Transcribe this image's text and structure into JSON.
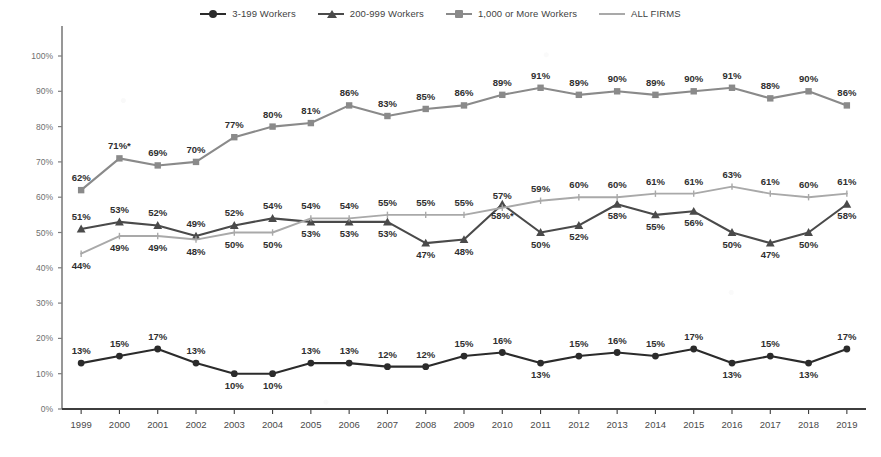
{
  "chart_data": {
    "type": "line",
    "title": "",
    "subtitle": "",
    "xlabel": "",
    "ylabel": "",
    "ylim": [
      0,
      100
    ],
    "ytick_labels": [
      "0%",
      "10%",
      "20%",
      "30%",
      "40%",
      "50%",
      "60%",
      "70%",
      "80%",
      "90%",
      "100%"
    ],
    "ytick_values": [
      0,
      10,
      20,
      30,
      40,
      50,
      60,
      70,
      80,
      90,
      100
    ],
    "grid": false,
    "legend_position": "top-center",
    "categories": [
      "1999",
      "2000",
      "2001",
      "2002",
      "2003",
      "2004",
      "2005",
      "2006",
      "2007",
      "2008",
      "2009",
      "2010",
      "2011",
      "2012",
      "2013",
      "2014",
      "2015",
      "2016",
      "2017",
      "2018",
      "2019"
    ],
    "x": [
      1999,
      2000,
      2001,
      2002,
      2003,
      2004,
      2005,
      2006,
      2007,
      2008,
      2009,
      2010,
      2011,
      2012,
      2013,
      2014,
      2015,
      2016,
      2017,
      2018,
      2019
    ],
    "series": [
      {
        "name": "3-199 Workers",
        "color": "#2b2b2b",
        "marker": "circle",
        "values": [
          13,
          15,
          17,
          13,
          10,
          10,
          13,
          13,
          12,
          12,
          15,
          16,
          13,
          15,
          16,
          15,
          17,
          13,
          15,
          13,
          17
        ],
        "labels": [
          "13%",
          "15%",
          "17%",
          "13%",
          "10%",
          "10%",
          "13%",
          "13%",
          "12%",
          "12%",
          "15%",
          "16%",
          "13%",
          "15%",
          "16%",
          "15%",
          "17%",
          "13%",
          "15%",
          "13%",
          "17%"
        ],
        "label_side": [
          "above",
          "above",
          "above",
          "above",
          "below",
          "below",
          "above",
          "above",
          "above",
          "above",
          "above",
          "above",
          "below",
          "above",
          "above",
          "above",
          "above",
          "below",
          "above",
          "below",
          "above"
        ]
      },
      {
        "name": "200-999 Workers",
        "color": "#4a4a4a",
        "marker": "triangle",
        "values": [
          51,
          53,
          52,
          49,
          52,
          54,
          53,
          53,
          53,
          47,
          48,
          58,
          50,
          52,
          58,
          55,
          56,
          50,
          47,
          50,
          58
        ],
        "labels": [
          "51%",
          "53%",
          "52%",
          "49%",
          "52%",
          "54%",
          "53%",
          "53%",
          "53%",
          "47%",
          "48%",
          "58%*",
          "50%",
          "52%",
          "58%",
          "55%",
          "56%",
          "50%",
          "47%",
          "50%",
          "58%"
        ],
        "label_side": [
          "above",
          "above",
          "above",
          "above",
          "above",
          "above",
          "below",
          "below",
          "below",
          "below",
          "below",
          "below",
          "below",
          "below",
          "below",
          "below",
          "below",
          "below",
          "below",
          "below",
          "below"
        ]
      },
      {
        "name": "1,000 or More Workers",
        "color": "#8a8a8a",
        "marker": "square",
        "values": [
          62,
          71,
          69,
          70,
          77,
          80,
          81,
          86,
          83,
          85,
          86,
          89,
          91,
          89,
          90,
          89,
          90,
          91,
          88,
          90,
          86
        ],
        "labels": [
          "62%",
          "71%*",
          "69%",
          "70%",
          "77%",
          "80%",
          "81%",
          "86%",
          "83%",
          "85%",
          "86%",
          "89%",
          "91%",
          "89%",
          "90%",
          "89%",
          "90%",
          "91%",
          "88%",
          "90%",
          "86%"
        ],
        "label_side": [
          "above",
          "above",
          "above",
          "above",
          "above",
          "above",
          "above",
          "above",
          "above",
          "above",
          "above",
          "above",
          "above",
          "above",
          "above",
          "above",
          "above",
          "above",
          "above",
          "above",
          "above"
        ]
      },
      {
        "name": "ALL FIRMS",
        "color": "#a9a9a9",
        "marker": "tick",
        "values": [
          44,
          49,
          49,
          48,
          50,
          50,
          54,
          54,
          55,
          55,
          55,
          57,
          59,
          60,
          60,
          61,
          61,
          63,
          61,
          60,
          61
        ],
        "labels": [
          "44%",
          "49%",
          "49%",
          "48%",
          "50%",
          "50%",
          "54%",
          "54%",
          "55%",
          "55%",
          "55%",
          "57%",
          "59%",
          "60%",
          "60%",
          "61%",
          "61%",
          "63%",
          "61%",
          "60%",
          "61%"
        ],
        "label_side": [
          "below",
          "below",
          "below",
          "below",
          "below",
          "below",
          "above",
          "above",
          "above",
          "above",
          "above",
          "above",
          "above",
          "above",
          "above",
          "above",
          "above",
          "above",
          "above",
          "above",
          "above"
        ]
      }
    ]
  },
  "legend": {
    "items": [
      {
        "label": "3-199 Workers",
        "marker": "circle",
        "color": "#2b2b2b"
      },
      {
        "label": "200-999 Workers",
        "marker": "triangle",
        "color": "#4a4a4a"
      },
      {
        "label": "1,000 or More Workers",
        "marker": "square",
        "color": "#8a8a8a"
      },
      {
        "label": "ALL FIRMS",
        "marker": "line",
        "color": "#a9a9a9"
      }
    ]
  },
  "axes": {
    "y_axis_color": "#7d7d7d",
    "x_axis_color": "#3d3d3d"
  }
}
